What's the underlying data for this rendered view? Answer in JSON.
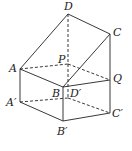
{
  "diagram": {
    "type": "geometry-solid",
    "points": {
      "D": {
        "label": "D",
        "x": 68,
        "y": 14
      },
      "C": {
        "label": "C",
        "x": 110,
        "y": 34
      },
      "A": {
        "label": "A",
        "x": 20,
        "y": 69
      },
      "P": {
        "label": "P",
        "x": 68,
        "y": 64
      },
      "Q": {
        "label": "Q",
        "x": 110,
        "y": 80
      },
      "B": {
        "label": "B",
        "x": 63,
        "y": 87
      },
      "Dp": {
        "label": "D′",
        "x": 68,
        "y": 98
      },
      "Ap": {
        "label": "A′",
        "x": 20,
        "y": 102
      },
      "Cp": {
        "label": "C′",
        "x": 110,
        "y": 113
      },
      "Bp": {
        "label": "B′",
        "x": 63,
        "y": 121
      }
    },
    "solid_edges": [
      "A-D",
      "D-C",
      "C-B",
      "A-B",
      "C-C'",
      "B-B'",
      "A-A'",
      "A'-B'",
      "B'-C'",
      "B-Q",
      "Q-C'"
    ],
    "dashed_edges": [
      "D-D'",
      "A-P",
      "P-Q",
      "A'-D'",
      "D'-C'"
    ],
    "stroke_color": "#222222"
  }
}
